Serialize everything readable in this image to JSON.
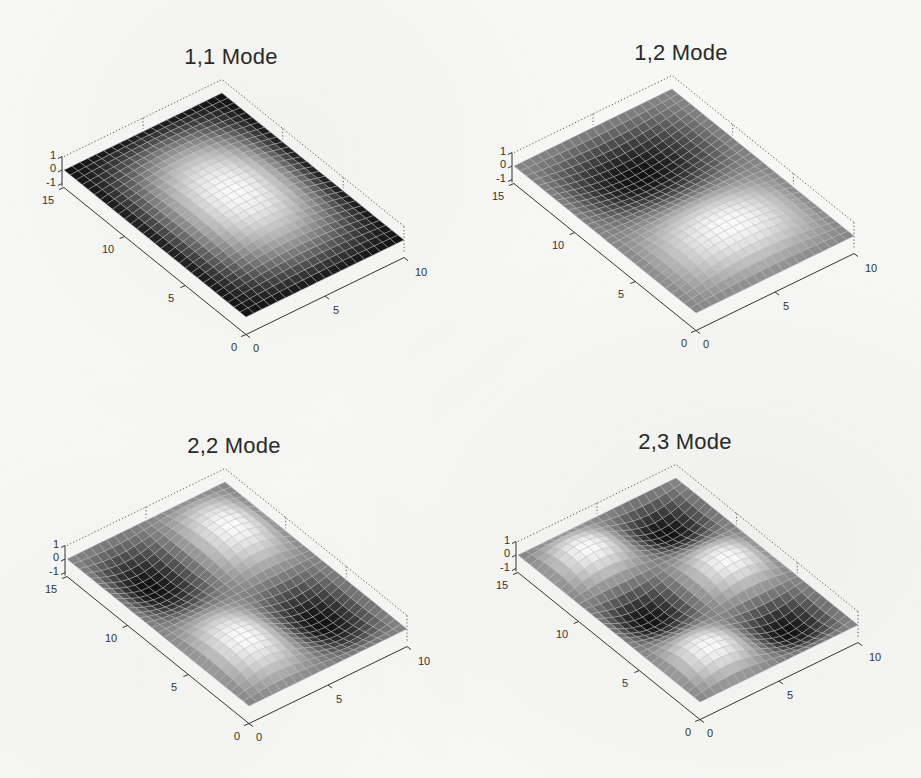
{
  "figure": {
    "background": "#f7f7f6",
    "surface_colormap": "gray",
    "grid_line_color": "#b8b8b8"
  },
  "chart_data": [
    {
      "type": "surface",
      "title": "1,1 Mode",
      "mode": [
        1,
        1
      ],
      "function": "sin(m*pi*x/10)*sin(n*pi*y/15)",
      "x_range": [
        0,
        10
      ],
      "y_range": [
        0,
        15
      ],
      "z_range": [
        -1,
        1
      ],
      "x_ticks": [
        "0",
        "5",
        "10"
      ],
      "y_ticks": [
        "0",
        "5",
        "10",
        "15"
      ],
      "z_ticks": [
        "-1",
        "0",
        "1"
      ],
      "mesh": [
        20,
        30
      ],
      "offset": [
        0,
        0
      ]
    },
    {
      "type": "surface",
      "title": "1,2 Mode",
      "mode": [
        1,
        2
      ],
      "function": "sin(m*pi*x/10)*sin(n*pi*y/15)",
      "x_range": [
        0,
        10
      ],
      "y_range": [
        0,
        15
      ],
      "z_range": [
        -1,
        1
      ],
      "x_ticks": [
        "0",
        "5",
        "10"
      ],
      "y_ticks": [
        "0",
        "5",
        "10",
        "15"
      ],
      "z_ticks": [
        "-1",
        "0",
        "1"
      ],
      "mesh": [
        20,
        30
      ],
      "offset": [
        450,
        -4
      ]
    },
    {
      "type": "surface",
      "title": "2,2 Mode",
      "mode": [
        2,
        2
      ],
      "function": "sin(m*pi*x/10)*sin(n*pi*y/15)",
      "x_range": [
        0,
        10
      ],
      "y_range": [
        0,
        15
      ],
      "z_range": [
        -1,
        1
      ],
      "x_ticks": [
        "0",
        "5",
        "10"
      ],
      "y_ticks": [
        "0",
        "5",
        "10",
        "15"
      ],
      "z_ticks": [
        "-1",
        "0",
        "1"
      ],
      "mesh": [
        20,
        30
      ],
      "offset": [
        3,
        389
      ]
    },
    {
      "type": "surface",
      "title": "2,3 Mode",
      "mode": [
        2,
        3
      ],
      "function": "sin(m*pi*x/10)*sin(n*pi*y/15)",
      "x_range": [
        0,
        10
      ],
      "y_range": [
        0,
        15
      ],
      "z_range": [
        -1,
        1
      ],
      "x_ticks": [
        "0",
        "5",
        "10"
      ],
      "y_ticks": [
        "0",
        "5",
        "10",
        "15"
      ],
      "z_ticks": [
        "-1",
        "0",
        "1"
      ],
      "mesh": [
        20,
        30
      ],
      "offset": [
        454,
        385
      ]
    }
  ],
  "plots": [
    {
      "title": "1,1 Mode",
      "x_ticks": [
        "0",
        "5",
        "10"
      ],
      "y_ticks": [
        "0",
        "5",
        "10",
        "15"
      ],
      "z_ticks": [
        "1",
        "0",
        "-1"
      ]
    },
    {
      "title": "1,2 Mode",
      "x_ticks": [
        "0",
        "5",
        "10"
      ],
      "y_ticks": [
        "0",
        "5",
        "10",
        "15"
      ],
      "z_ticks": [
        "1",
        "0",
        "-1"
      ]
    },
    {
      "title": "2,2 Mode",
      "x_ticks": [
        "0",
        "5",
        "10"
      ],
      "y_ticks": [
        "0",
        "5",
        "10",
        "15"
      ],
      "z_ticks": [
        "1",
        "0",
        "-1"
      ]
    },
    {
      "title": "2,3 Mode",
      "x_ticks": [
        "0",
        "5",
        "10"
      ],
      "y_ticks": [
        "0",
        "5",
        "10",
        "15"
      ],
      "z_ticks": [
        "1",
        "0",
        "-1"
      ]
    }
  ]
}
